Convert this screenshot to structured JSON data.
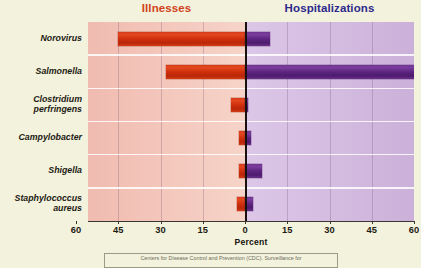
{
  "headings": {
    "left": "Illnesses",
    "right": "Hospitalizations",
    "left_color": "#d1421c",
    "right_color": "#2d2a8c"
  },
  "axis": {
    "title": "Percent",
    "ticks": [
      "60",
      "45",
      "30",
      "15",
      "0",
      "15",
      "30",
      "45",
      "60"
    ]
  },
  "caption": {
    "text": "Centers for Disease Control and Prevention (CDC). Surveillance for"
  },
  "chart_data": {
    "type": "bar",
    "orientation": "horizontal-diverging",
    "title": "",
    "xlabel": "Percent",
    "ylabel": "",
    "xlim": [
      -60,
      60
    ],
    "grid": true,
    "legend_position": "top",
    "categories": [
      "Norovirus",
      "Salmonella",
      "Clostridium perfringens",
      "Campylobacter",
      "Shigella",
      "Staphylococcus aureus"
    ],
    "series": [
      {
        "name": "Illnesses",
        "color": "#cf2f0c",
        "side": "left",
        "values": [
          45,
          28,
          5,
          2,
          2,
          3
        ]
      },
      {
        "name": "Hospitalizations",
        "color": "#5d2480",
        "side": "right",
        "values": [
          9,
          60,
          1,
          2,
          6,
          3
        ]
      }
    ]
  }
}
